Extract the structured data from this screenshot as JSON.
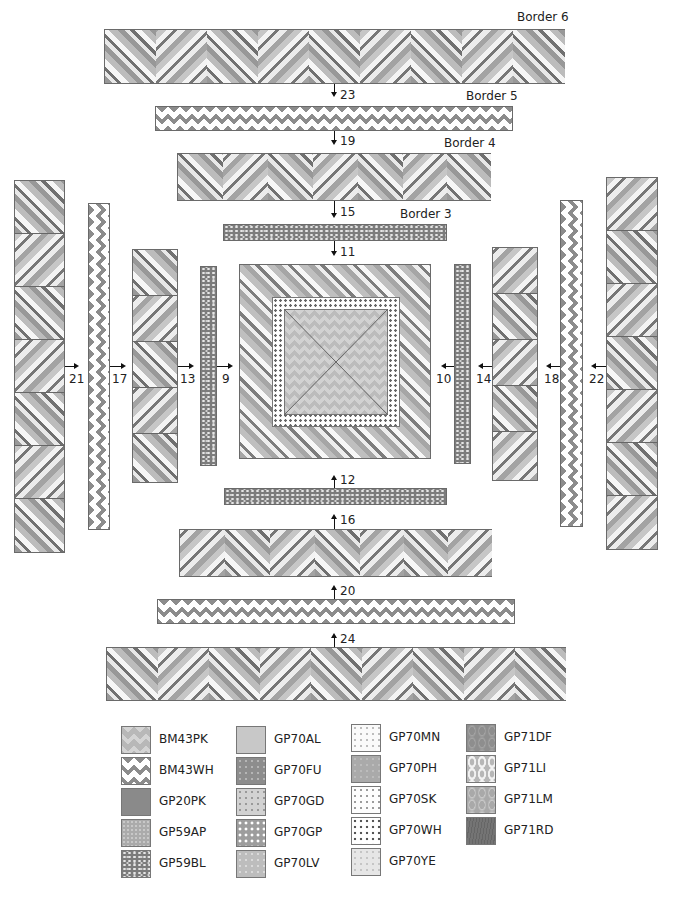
{
  "diagram": {
    "border_labels": {
      "border6": "Border 6",
      "border5": "Border 5",
      "border4": "Border 4",
      "border3": "Border 3"
    },
    "step_numbers": {
      "top": [
        "23",
        "19",
        "15",
        "11"
      ],
      "bottom": [
        "12",
        "16",
        "20",
        "24"
      ],
      "left": [
        "21",
        "17",
        "13",
        "9"
      ],
      "right": [
        "10",
        "14",
        "18",
        "22"
      ]
    },
    "arrows": {
      "top": "down",
      "bottom": "up",
      "left": "right",
      "right": "left"
    },
    "borders": [
      {
        "id": "border6-top",
        "label": "Border 6",
        "fabric": "herringbone",
        "blocks": 9
      },
      {
        "id": "border5-top",
        "label": "Border 5",
        "fabric": "BM43WH"
      },
      {
        "id": "border4-top",
        "label": "Border 4",
        "fabric": "herringbone",
        "blocks": 7
      },
      {
        "id": "border3-top",
        "label": "Border 3",
        "fabric": "GP59BL"
      },
      {
        "id": "border3-bottom",
        "fabric": "GP59BL"
      },
      {
        "id": "border4-bottom",
        "fabric": "herringbone",
        "blocks": 7
      },
      {
        "id": "border5-bottom",
        "fabric": "BM43WH"
      },
      {
        "id": "border6-bottom",
        "fabric": "herringbone",
        "blocks": 9
      },
      {
        "id": "border3-left",
        "fabric": "GP59BL"
      },
      {
        "id": "border4-left",
        "fabric": "herringbone",
        "blocks": 5
      },
      {
        "id": "border5-left",
        "fabric": "BM43WH"
      },
      {
        "id": "border6-left",
        "fabric": "herringbone",
        "blocks": 7
      },
      {
        "id": "border3-right",
        "fabric": "GP59BL"
      },
      {
        "id": "border4-right",
        "fabric": "herringbone",
        "blocks": 5
      },
      {
        "id": "border5-right",
        "fabric": "BM43WH"
      },
      {
        "id": "border6-right",
        "fabric": "herringbone",
        "blocks": 7
      }
    ],
    "center": {
      "core_fabric": "BM43PK",
      "ring_fabric": "GP70WH",
      "outer": "herringbone"
    }
  },
  "legend": {
    "columns": [
      [
        {
          "code": "BM43PK",
          "swatch": "zz-pk"
        },
        {
          "code": "BM43WH",
          "swatch": "zz-h"
        },
        {
          "code": "GP20PK",
          "swatch": "sw-gp20pk"
        },
        {
          "code": "GP59AP",
          "swatch": "sw-gp59ap"
        },
        {
          "code": "GP59BL",
          "swatch": "speck"
        }
      ],
      [
        {
          "code": "GP70AL",
          "swatch": "sw-gp70al"
        },
        {
          "code": "GP70FU",
          "swatch": "sw-gp70fu"
        },
        {
          "code": "GP70GD",
          "swatch": "sw-gp70gd"
        },
        {
          "code": "GP70GP",
          "swatch": "sw-gp70gp"
        },
        {
          "code": "GP70LV",
          "swatch": "sw-gp70lv"
        }
      ],
      [
        {
          "code": "GP70MN",
          "swatch": "sw-gp70mn"
        },
        {
          "code": "GP70PH",
          "swatch": "sw-gp70ph"
        },
        {
          "code": "GP70SK",
          "swatch": "sw-gp70sk"
        },
        {
          "code": "GP70WH",
          "swatch": "dots-wh"
        },
        {
          "code": "GP70YE",
          "swatch": "sw-gp70ye"
        }
      ],
      [
        {
          "code": "GP71DF",
          "swatch": "sw-gp71df"
        },
        {
          "code": "GP71LI",
          "swatch": "sw-gp71li"
        },
        {
          "code": "GP71LM",
          "swatch": "sw-gp71lm"
        },
        {
          "code": "GP71RD",
          "swatch": "sw-gp71rd"
        }
      ]
    ]
  },
  "colors": {
    "outline": "#6a6a6a",
    "text": "#222222",
    "arrow": "#111111",
    "zigzag_dark": "#8c8c8c",
    "background": "#ffffff"
  }
}
